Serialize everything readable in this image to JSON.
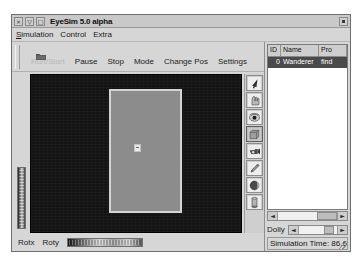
{
  "window": {
    "title": "EyeSim 5.0 alpha",
    "controls": {
      "close": "×",
      "minimize": "▽",
      "maximize": "□"
    }
  },
  "menubar": {
    "items": [
      {
        "mnemonic": "S",
        "rest": "imulation"
      },
      {
        "mnemonic": "",
        "rest": "Control"
      },
      {
        "mnemonic": "",
        "rest": "Extra"
      }
    ]
  },
  "toolbar": {
    "open_icon": "folder-icon",
    "buttons": [
      {
        "label": "Run/Start",
        "disabled": true
      },
      {
        "label": "Pause",
        "disabled": false
      },
      {
        "label": "Stop",
        "disabled": false
      },
      {
        "label": "Mode",
        "disabled": false
      },
      {
        "label": "Change Pos",
        "disabled": false
      },
      {
        "label": "Settings",
        "disabled": false
      }
    ]
  },
  "viewport": {
    "name": "3d-simulation-view",
    "background_color": "#141414",
    "arena_color": "#8c8c8c",
    "arena_border_color": "#d4d4d4",
    "robot_color": "#e9e9e9"
  },
  "tool_strip": {
    "items": [
      {
        "icon": "cursor-arrow-icon",
        "selected": false
      },
      {
        "icon": "hand-icon",
        "selected": false
      },
      {
        "icon": "eye-rotate-icon",
        "selected": false
      },
      {
        "icon": "box-icon",
        "selected": true
      },
      {
        "icon": "camera-icon",
        "selected": false
      },
      {
        "icon": "pencil-icon",
        "selected": false
      },
      {
        "icon": "sphere-icon",
        "selected": false
      },
      {
        "icon": "cylinder-icon",
        "selected": false
      }
    ]
  },
  "sliders": {
    "rotx_label": "Rotx",
    "roty_label": "Roty",
    "dolly_label": "Dolly"
  },
  "object_list": {
    "columns": [
      "ID",
      "Name",
      "Pro"
    ],
    "rows": [
      {
        "id": "0",
        "name": "Wanderer",
        "program": "find"
      }
    ]
  },
  "scrollbars": {
    "left_arrow": "◄",
    "right_arrow": "►"
  },
  "status": {
    "simulation_time": "Simulation Time: 86.6"
  }
}
